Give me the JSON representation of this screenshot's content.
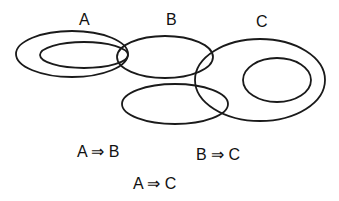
{
  "diagram": {
    "type": "euler-venn",
    "labels": {
      "a": "A",
      "b": "B",
      "c": "C"
    },
    "ellipses": [
      {
        "id": "a-outer",
        "cx": 72,
        "cy": 54,
        "rx": 56,
        "ry": 23
      },
      {
        "id": "a-inner",
        "cx": 84,
        "cy": 55,
        "rx": 44,
        "ry": 13
      },
      {
        "id": "b",
        "cx": 165,
        "cy": 57,
        "rx": 48,
        "ry": 21
      },
      {
        "id": "b-lower",
        "cx": 175,
        "cy": 104,
        "rx": 53,
        "ry": 20
      },
      {
        "id": "c-outer",
        "cx": 260,
        "cy": 80,
        "rx": 65,
        "ry": 41
      },
      {
        "id": "c-inner",
        "cx": 277,
        "cy": 80,
        "rx": 34,
        "ry": 22
      }
    ],
    "statements": [
      {
        "text": "A ⇒ B"
      },
      {
        "text": "B ⇒ C"
      },
      {
        "text": "A ⇒ C"
      }
    ]
  }
}
